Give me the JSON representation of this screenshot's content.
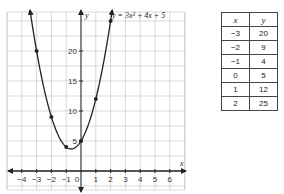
{
  "chart_data": {
    "type": "line",
    "title": "",
    "equation": "y = 3x² + 4x + 5",
    "xlabel": "x",
    "ylabel": "y",
    "xlim": [
      -5,
      7
    ],
    "ylim": [
      -3,
      27
    ],
    "x_ticks": [
      "-4",
      "-3",
      "-2",
      "-1",
      "0",
      "1",
      "2",
      "3",
      "4",
      "5",
      "6"
    ],
    "y_ticks": [
      "5",
      "10",
      "15",
      "20"
    ],
    "grid": true,
    "series": [
      {
        "name": "y = 3x² + 4x + 5",
        "points": [
          {
            "x": -3,
            "y": 20
          },
          {
            "x": -2,
            "y": 9
          },
          {
            "x": -1,
            "y": 4
          },
          {
            "x": 0,
            "y": 5
          },
          {
            "x": 1,
            "y": 12
          },
          {
            "x": 2,
            "y": 25
          }
        ]
      }
    ]
  },
  "graph": {
    "equation_label": "y = 3x² + 4x + 5",
    "x_axis_label": "x",
    "y_axis_label": "y"
  },
  "table": {
    "headers": [
      "x",
      "y"
    ],
    "rows": [
      [
        "−3",
        "20"
      ],
      [
        "−2",
        "9"
      ],
      [
        "−1",
        "4"
      ],
      [
        "0",
        "5"
      ],
      [
        "1",
        "12"
      ],
      [
        "2",
        "25"
      ]
    ]
  }
}
